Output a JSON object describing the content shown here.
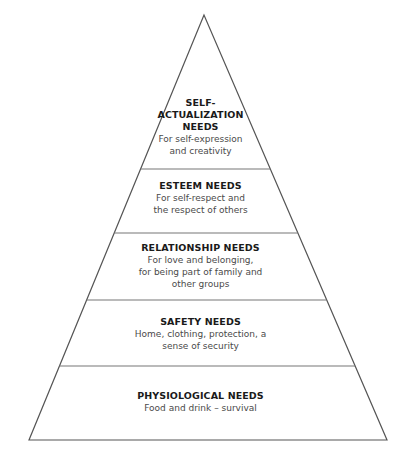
{
  "diagram": {
    "type": "pyramid",
    "stroke_color": "#555555",
    "divider_color": "#777777",
    "tiers": [
      {
        "title": "SELF-\nACTUALIZATION\nNEEDS",
        "description": "For self-expression\nand creativity"
      },
      {
        "title": "ESTEEM NEEDS",
        "description": "For self-respect and\nthe respect of others"
      },
      {
        "title": "RELATIONSHIP NEEDS",
        "description": "For love and belonging,\nfor being part of family and\nother groups"
      },
      {
        "title": "SAFETY NEEDS",
        "description": "Home, clothing, protection, a\nsense of security"
      },
      {
        "title": "PHYSIOLOGICAL NEEDS",
        "description": "Food and drink – survival"
      }
    ]
  }
}
